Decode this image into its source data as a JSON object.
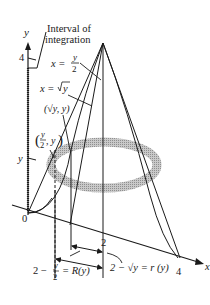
{
  "diagram": {
    "title_callout": {
      "line1": "Interval of",
      "line2": "integration"
    },
    "axes": {
      "y_axis_label": "y",
      "x_axis_label": "x",
      "origin_label": "0",
      "y_tick_top": "4",
      "y_tick_mid": "y",
      "x_tick_2": "2",
      "x_tick_4": "4"
    },
    "curves": {
      "line_label": {
        "lhs": "x =",
        "num": "y",
        "den": "2"
      },
      "sqrt_label": {
        "lhs": "x =",
        "rad": "y"
      }
    },
    "points": {
      "sqrt_point": "(√y, y)",
      "half_point": {
        "num": "y",
        "den": "2",
        "rest": ", y"
      }
    },
    "radii": {
      "outer": {
        "pre": "2 −",
        "num": "y",
        "den": "2",
        "post": "= R(y)"
      },
      "inner": "2 − √y = r (y)"
    },
    "colors": {
      "ink": "#1a1a1a",
      "washer": "#9a9a9a",
      "washer_light": "#c4c4c4"
    }
  }
}
